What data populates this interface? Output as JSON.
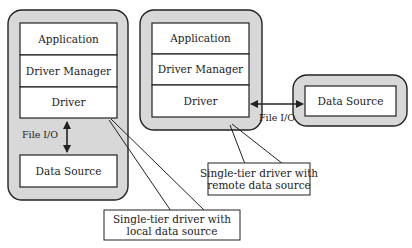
{
  "diagram": {
    "left_stack": {
      "layers": [
        "Application",
        "Driver Manager",
        "Driver"
      ],
      "data_source": "Data Source",
      "connection_label": "File I/O"
    },
    "middle_stack": {
      "layers": [
        "Application",
        "Driver Manager",
        "Driver"
      ],
      "connection_label": "File I/O"
    },
    "remote": {
      "data_source": "Data Source"
    },
    "callouts": {
      "local": [
        "Single-tier driver with",
        "local data source"
      ],
      "remote": [
        "Single-tier driver with",
        "remote data source"
      ]
    }
  }
}
